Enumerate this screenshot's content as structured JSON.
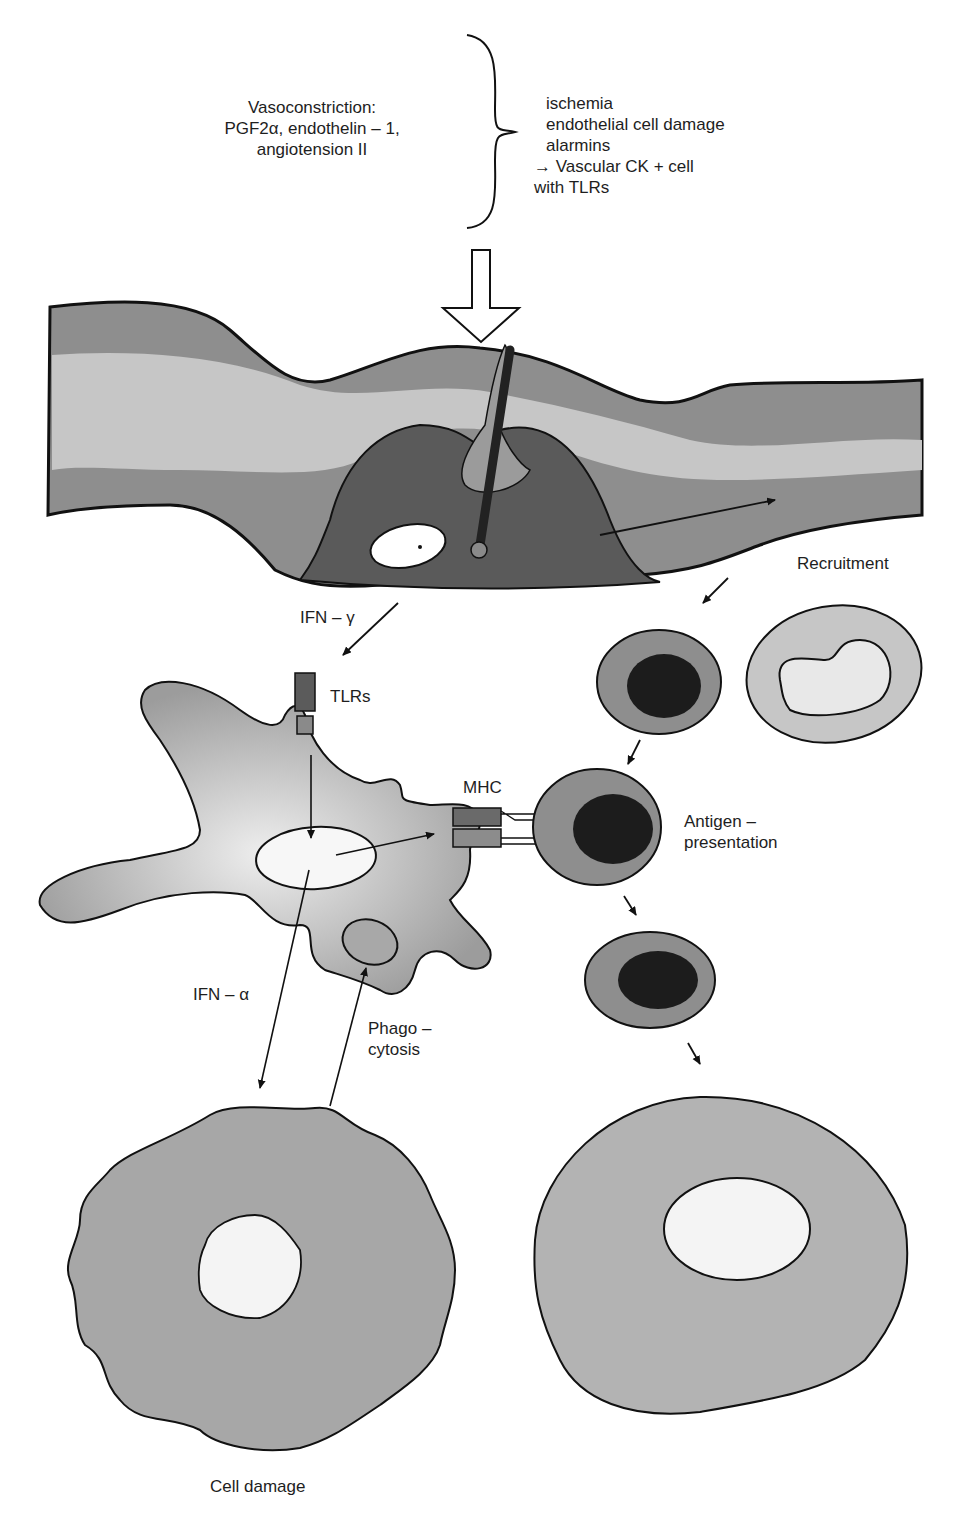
{
  "diagram": {
    "top_left_text": {
      "lines": [
        "Vasoconstriction:",
        "PGF2α, endothelin – 1,",
        "angiotension II"
      ]
    },
    "top_right_text": {
      "lines": [
        "ischemia",
        "endothelial cell damage",
        "alarmins",
        "→ Vascular CK + cell",
        "with TLRs"
      ]
    },
    "labels": {
      "recruitment": "Recruitment",
      "ifn_gamma": "IFN – γ",
      "tlrs": "TLRs",
      "mhc": "MHC",
      "antigen_presentation_1": "Antigen –",
      "antigen_presentation_2": "presentation",
      "ifn_alpha": "IFN – α",
      "phagocytosis_1": "Phago –",
      "phagocytosis_2": "cytosis",
      "cell_damage": "Cell damage"
    },
    "colors": {
      "vessel_outer": "#8c8c8c",
      "vessel_inner": "#c4c4c4",
      "lesion": "#5a5a5a",
      "cell_fill": "#9a9a9a",
      "nucleus_dark": "#1c1c1c",
      "outline": "#111111"
    }
  }
}
